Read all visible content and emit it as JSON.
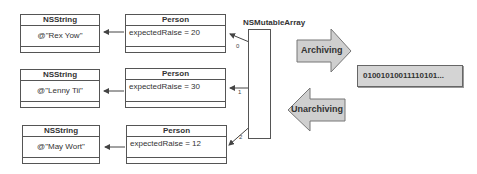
{
  "diagram": {
    "array": {
      "label": "NSMutableArray",
      "indices": [
        "0",
        "1",
        "2"
      ]
    },
    "rows": [
      {
        "string_header": "NSString",
        "string_value": "@\"Rex Yow\"",
        "person_header": "Person",
        "person_value": "expectedRaise = 20"
      },
      {
        "string_header": "NSString",
        "string_value": "@\"Lenny Tii\"",
        "person_header": "Person",
        "person_value": "expectedRaise = 30"
      },
      {
        "string_header": "NSString",
        "string_value": "@\"May Wort\"",
        "person_header": "Person",
        "person_value": "expectedRaise = 12"
      }
    ],
    "arrows": {
      "archiving": "Archiving",
      "unarchiving": "Unarchiving"
    },
    "binary": "01001010011110101...",
    "colors": {
      "arrow_fill": "#cfcfcf",
      "line": "#555555",
      "binary_bg": "#d4d4d4"
    }
  }
}
